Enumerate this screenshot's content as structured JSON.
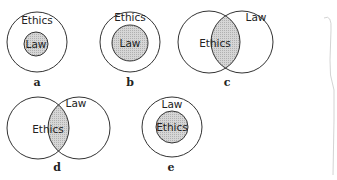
{
  "diagrams": [
    {
      "caption": "a",
      "outer_label": "Ethics",
      "inner_label": "Law",
      "type": "nested"
    },
    {
      "caption": "b",
      "outer_label": "Ethics",
      "inner_label": "Law",
      "type": "nested"
    },
    {
      "caption": "c",
      "left_label": "Ethics",
      "right_label": "Law",
      "type": "overlap"
    },
    {
      "caption": "d",
      "left_label": "Ethics",
      "right_label": "Law",
      "type": "overlap"
    },
    {
      "caption": "e",
      "outer_label": "Law",
      "inner_label": "Ethics",
      "type": "nested"
    }
  ],
  "colors": {
    "fill": "#cfcfcf",
    "stroke": "#333333"
  }
}
